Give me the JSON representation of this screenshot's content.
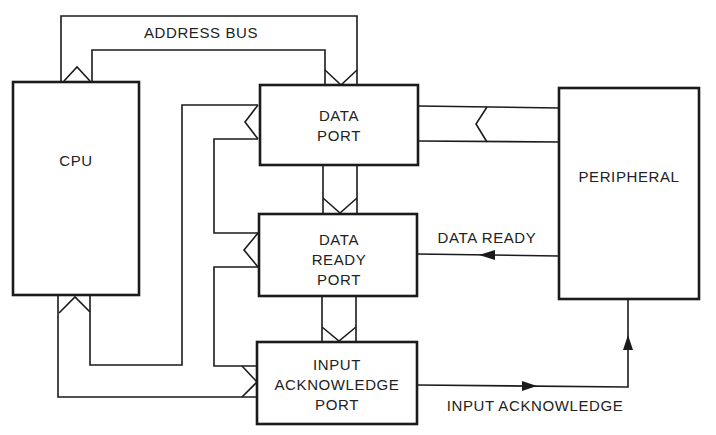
{
  "diagram": {
    "blocks": {
      "cpu": {
        "label": "CPU"
      },
      "data_port": {
        "line1": "DATA",
        "line2": "PORT"
      },
      "data_ready_port": {
        "line1": "DATA",
        "line2": "READY",
        "line3": "PORT"
      },
      "input_ack_port": {
        "line1": "INPUT",
        "line2": "ACKNOWLEDGE",
        "line3": "PORT"
      },
      "peripheral": {
        "label": "PERIPHERAL"
      }
    },
    "signals": {
      "address_bus": "ADDRESS BUS",
      "data_ready": "DATA READY",
      "input_acknowledge": "INPUT ACKNOWLEDGE"
    },
    "connections": [
      {
        "from": "CPU",
        "to": "DATA PORT",
        "type": "address bus"
      },
      {
        "from": "CPU",
        "to": "DATA PORT",
        "type": "data bus"
      },
      {
        "from": "CPU",
        "to": "DATA READY PORT",
        "type": "data bus"
      },
      {
        "from": "CPU",
        "to": "INPUT ACKNOWLEDGE PORT",
        "type": "data bus"
      },
      {
        "from": "DATA PORT",
        "to": "DATA READY PORT",
        "type": "address bus"
      },
      {
        "from": "DATA READY PORT",
        "to": "INPUT ACKNOWLEDGE PORT",
        "type": "address bus"
      },
      {
        "from": "PERIPHERAL",
        "to": "DATA PORT",
        "type": "data bus"
      },
      {
        "from": "PERIPHERAL",
        "to": "DATA READY PORT",
        "type": "DATA READY signal"
      },
      {
        "from": "INPUT ACKNOWLEDGE PORT",
        "to": "PERIPHERAL",
        "type": "INPUT ACKNOWLEDGE signal"
      }
    ],
    "colors": {
      "line": "#1b1b1b",
      "background": "#ffffff"
    }
  }
}
